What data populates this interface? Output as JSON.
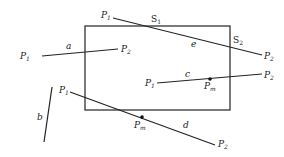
{
  "diagram": {
    "title": "",
    "colors": {
      "stroke": "#222222",
      "background": "#ffffff"
    },
    "window": {
      "x1": 85,
      "y1": 26,
      "x2": 230,
      "y2": 110
    },
    "segments": [
      {
        "id": "a",
        "label": "a",
        "p1": {
          "name": "P",
          "sub": "1",
          "x": 42,
          "y": 56
        },
        "p2": {
          "name": "P",
          "sub": "2",
          "x": 118,
          "y": 49
        }
      },
      {
        "id": "b",
        "label": "b",
        "p1": {
          "x": 52,
          "y": 87
        },
        "p2": {
          "x": 44,
          "y": 142
        }
      },
      {
        "id": "c",
        "label": "c",
        "p1": {
          "name": "P",
          "sub": "1",
          "x": 157,
          "y": 83
        },
        "p2": {
          "name": "P",
          "sub": "2",
          "x": 262,
          "y": 74
        },
        "mid": {
          "name": "P",
          "sub": "m",
          "x": 210,
          "y": 79
        }
      },
      {
        "id": "d",
        "label": "d",
        "p1": {
          "name": "P",
          "sub": "1",
          "x": 70,
          "y": 92
        },
        "p2": {
          "name": "P",
          "sub": "2",
          "x": 215,
          "y": 145
        },
        "mid": {
          "name": "P",
          "sub": "m",
          "x": 142,
          "y": 117
        }
      },
      {
        "id": "e",
        "label": "e",
        "p1": {
          "name": "P",
          "sub": "1",
          "x": 113,
          "y": 18
        },
        "p2": {
          "name": "P",
          "sub": "2",
          "x": 262,
          "y": 55
        },
        "intersections": [
          {
            "name": "S",
            "sub": "1",
            "x": 155,
            "y": 25
          },
          {
            "name": "S",
            "sub": "2",
            "x": 230,
            "y": 42
          }
        ]
      }
    ],
    "labels": {
      "a_P1": {
        "base": "P",
        "sub": "1"
      },
      "a_P2": {
        "base": "P",
        "sub": "2"
      },
      "a": "a",
      "b": "b",
      "c_P1": {
        "base": "P",
        "sub": "1"
      },
      "c_P2": {
        "base": "P",
        "sub": "2"
      },
      "c_Pm": {
        "base": "P",
        "sub": "m"
      },
      "c": "c",
      "d_P1": {
        "base": "P",
        "sub": "1"
      },
      "d_P2": {
        "base": "P",
        "sub": "2"
      },
      "d_Pm": {
        "base": "P",
        "sub": "m"
      },
      "d": "d",
      "e_P1": {
        "base": "P",
        "sub": "1"
      },
      "e_P2": {
        "base": "P",
        "sub": "2"
      },
      "e_S1": {
        "base": "S",
        "sub": "1"
      },
      "e_S2": {
        "base": "S",
        "sub": "2"
      },
      "e": "e"
    }
  }
}
